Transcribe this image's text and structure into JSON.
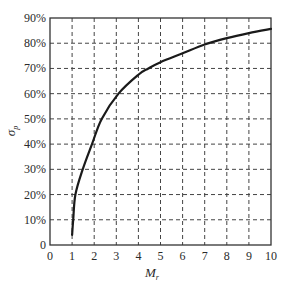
{
  "chart_data": {
    "type": "line",
    "title": "",
    "xlabel": "M",
    "xlabel_sub": "r",
    "ylabel": "σ",
    "ylabel_sub": "p",
    "xlim": [
      0,
      10
    ],
    "ylim": [
      0,
      90
    ],
    "x_ticks": [
      "0",
      "1",
      "2",
      "3",
      "4",
      "5",
      "6",
      "7",
      "8",
      "9",
      "10"
    ],
    "y_ticks": [
      "0",
      "10%",
      "20%",
      "30%",
      "40%",
      "50%",
      "60%",
      "70%",
      "80%",
      "90%"
    ],
    "grid": true,
    "grid_style": "dashed",
    "legend": null,
    "series": [
      {
        "name": "σp vs Mr",
        "color": "#1a1a1a",
        "x": [
          1.0,
          1.05,
          1.15,
          1.48,
          1.9,
          2.34,
          3.1,
          4.0,
          4.45,
          5.0,
          6.0,
          7.0,
          8.0,
          9.0,
          10.0
        ],
        "y": [
          4,
          10,
          20,
          30,
          40,
          50,
          60,
          67.5,
          70,
          72.5,
          76,
          79.5,
          82,
          84,
          85.7
        ]
      }
    ]
  }
}
